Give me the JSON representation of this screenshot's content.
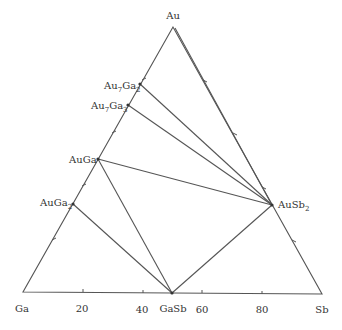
{
  "diagram": {
    "type": "ternary-phase-diagram",
    "vertices": {
      "top": {
        "label": "Au",
        "x": 173,
        "y": 27
      },
      "left": {
        "label": "Ga",
        "x": 23,
        "y": 292
      },
      "right": {
        "label": "Sb",
        "x": 322,
        "y": 294
      }
    },
    "axis_ticks": [
      {
        "label": "20",
        "x": 83
      },
      {
        "label": "40",
        "x": 143
      },
      {
        "label": "60",
        "x": 202
      },
      {
        "label": "80",
        "x": 262
      }
    ],
    "phases": [
      {
        "id": "au7ga2",
        "base": "Au",
        "sub1": "7",
        "mid": "Ga",
        "sub2": "2",
        "x": 140,
        "y": 84
      },
      {
        "id": "au7ga3",
        "base": "Au",
        "sub1": "7",
        "mid": "Ga",
        "sub2": "3",
        "x": 128,
        "y": 105
      },
      {
        "id": "auga",
        "base": "AuGa",
        "sub1": "",
        "mid": "",
        "sub2": "",
        "x": 98,
        "y": 159
      },
      {
        "id": "auga2",
        "base": "AuGa",
        "sub1": "2",
        "mid": "",
        "sub2": "",
        "x": 73,
        "y": 204
      },
      {
        "id": "gasb",
        "base": "GaSb",
        "x": 172,
        "y": 293
      },
      {
        "id": "ausb2",
        "base": "AuSb",
        "sub1": "2",
        "x": 272,
        "y": 205
      }
    ],
    "tie_lines": [
      [
        "Au",
        "AuSb2"
      ],
      [
        "Au7Ga2",
        "AuSb2"
      ],
      [
        "Au7Ga3",
        "AuSb2"
      ],
      [
        "AuGa",
        "AuSb2"
      ],
      [
        "AuGa",
        "GaSb"
      ],
      [
        "AuGa2",
        "GaSb"
      ],
      [
        "GaSb",
        "AuSb2"
      ]
    ]
  }
}
